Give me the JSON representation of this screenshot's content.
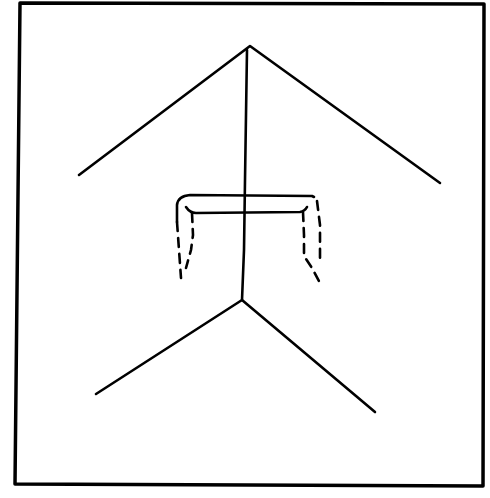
{
  "figure": {
    "colors": {
      "ink": "#000000",
      "background": "#ffffff"
    },
    "frame": {
      "x1": 19,
      "y1": 3,
      "x2": 483,
      "y2": 486
    },
    "upper_chevron": {
      "peak": [
        250,
        46
      ],
      "left_end": [
        79,
        175
      ],
      "right_end": [
        440,
        183
      ]
    },
    "stem": {
      "top": [
        247,
        50
      ],
      "bottom": [
        242,
        300
      ]
    },
    "lower_chevron": {
      "vertex": [
        242,
        300
      ],
      "left_end": [
        96,
        394
      ],
      "right_end": [
        375,
        412
      ]
    },
    "crossbar": {
      "left_x": 168,
      "right_x": 322,
      "top_y": 195,
      "bottom_y": 213
    }
  }
}
